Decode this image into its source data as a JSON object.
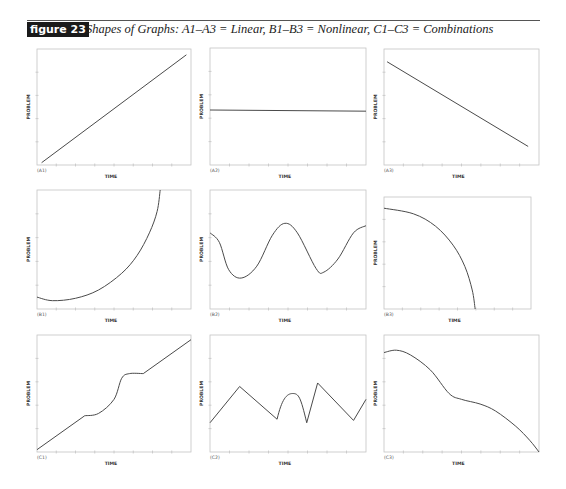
{
  "header": {
    "badge": "figure 23",
    "caption": "Shapes of Graphs: A1–A3 = Linear, B1–B3 = Nonlinear, C1–C3 = Combinations"
  },
  "chart_data": [
    {
      "id": "A1",
      "type": "line",
      "label": "(A1)",
      "xlabel": "TIME",
      "ylabel": "PROBLEM",
      "shape": "linear increasing",
      "frame": [
        37,
        49,
        191,
        165
      ],
      "points": [
        [
          0.03,
          0.02
        ],
        [
          0.97,
          0.95
        ]
      ]
    },
    {
      "id": "A2",
      "type": "line",
      "label": "(A2)",
      "xlabel": "TIME",
      "ylabel": "PROBLEM",
      "shape": "flat constant",
      "frame": [
        210,
        48,
        366,
        165
      ],
      "points": [
        [
          0.0,
          0.47
        ],
        [
          1.0,
          0.46
        ]
      ]
    },
    {
      "id": "A3",
      "type": "line",
      "label": "(A3)",
      "xlabel": "TIME",
      "ylabel": "PROBLEM",
      "shape": "linear decreasing",
      "frame": [
        384,
        49,
        539,
        165
      ],
      "points": [
        [
          0.02,
          0.89
        ],
        [
          0.93,
          0.16
        ]
      ]
    },
    {
      "id": "B1",
      "type": "line",
      "label": "(B1)",
      "xlabel": "TIME",
      "ylabel": "PROBLEM",
      "shape": "accelerating increase (concave up)",
      "frame": [
        37,
        190,
        191,
        309
      ],
      "points": [
        [
          0.0,
          0.1
        ],
        [
          0.1,
          0.07
        ],
        [
          0.25,
          0.09
        ],
        [
          0.4,
          0.16
        ],
        [
          0.55,
          0.3
        ],
        [
          0.65,
          0.45
        ],
        [
          0.73,
          0.64
        ],
        [
          0.78,
          0.82
        ],
        [
          0.8,
          1.0
        ]
      ]
    },
    {
      "id": "B2",
      "type": "line",
      "label": "(B2)",
      "xlabel": "TIME",
      "ylabel": "PROBLEM",
      "shape": "oscillating wave",
      "frame": [
        210,
        190,
        366,
        309
      ],
      "points": [
        [
          0.0,
          0.64
        ],
        [
          0.06,
          0.56
        ],
        [
          0.12,
          0.33
        ],
        [
          0.2,
          0.26
        ],
        [
          0.3,
          0.36
        ],
        [
          0.4,
          0.62
        ],
        [
          0.48,
          0.72
        ],
        [
          0.56,
          0.64
        ],
        [
          0.68,
          0.34
        ],
        [
          0.73,
          0.31
        ],
        [
          0.82,
          0.42
        ],
        [
          0.92,
          0.64
        ],
        [
          1.0,
          0.7
        ]
      ]
    },
    {
      "id": "B3",
      "type": "line",
      "label": "(B3)",
      "xlabel": "TIME",
      "ylabel": "PROBLEM",
      "shape": "accelerating decrease (concave down)",
      "frame": [
        384,
        197,
        531,
        309
      ],
      "points": [
        [
          0.0,
          0.9
        ],
        [
          0.2,
          0.85
        ],
        [
          0.35,
          0.74
        ],
        [
          0.47,
          0.57
        ],
        [
          0.55,
          0.38
        ],
        [
          0.6,
          0.17
        ],
        [
          0.62,
          0.0
        ]
      ]
    },
    {
      "id": "C1",
      "type": "line",
      "label": "(C1)",
      "xlabel": "TIME",
      "ylabel": "PROBLEM",
      "shape": "linear with S-bump",
      "frame": [
        37,
        335,
        191,
        452
      ],
      "points": [
        [
          0.0,
          0.02
        ],
        [
          0.31,
          0.31
        ],
        [
          0.4,
          0.33
        ],
        [
          0.5,
          0.45
        ],
        [
          0.55,
          0.63
        ],
        [
          0.6,
          0.67
        ],
        [
          0.69,
          0.67
        ],
        [
          1.0,
          0.96
        ]
      ]
    },
    {
      "id": "C2",
      "type": "line",
      "label": "(C2)",
      "xlabel": "TIME",
      "ylabel": "PROBLEM",
      "shape": "zigzag with arch",
      "frame": [
        210,
        335,
        366,
        452
      ],
      "points": [
        [
          0.0,
          0.25
        ],
        [
          0.19,
          0.56
        ],
        [
          0.43,
          0.28
        ],
        [
          0.46,
          0.4
        ],
        [
          0.53,
          0.5
        ],
        [
          0.58,
          0.44
        ],
        [
          0.62,
          0.25
        ],
        [
          0.69,
          0.59
        ],
        [
          0.92,
          0.27
        ],
        [
          1.0,
          0.45
        ]
      ]
    },
    {
      "id": "C3",
      "type": "line",
      "label": "(C3)",
      "xlabel": "TIME",
      "ylabel": "PROBLEM",
      "shape": "plateau, decline, shoulder, steep drop",
      "frame": [
        384,
        335,
        539,
        452
      ],
      "points": [
        [
          0.0,
          0.85
        ],
        [
          0.08,
          0.87
        ],
        [
          0.17,
          0.83
        ],
        [
          0.3,
          0.7
        ],
        [
          0.42,
          0.5
        ],
        [
          0.5,
          0.45
        ],
        [
          0.62,
          0.41
        ],
        [
          0.72,
          0.35
        ],
        [
          0.85,
          0.22
        ],
        [
          0.94,
          0.1
        ],
        [
          1.0,
          0.0
        ]
      ]
    }
  ]
}
